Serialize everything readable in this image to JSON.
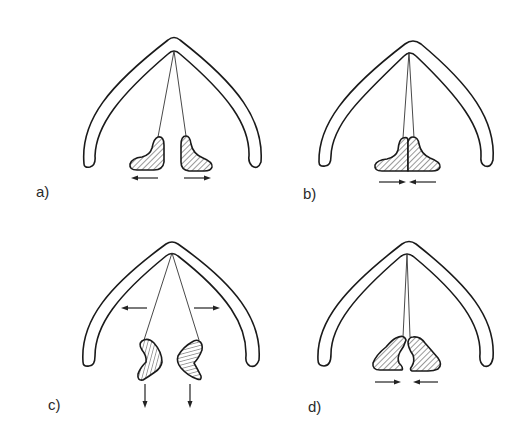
{
  "figure": {
    "panels": [
      {
        "id": "a",
        "label": "a)",
        "description": "Blocks pulled apart horizontally",
        "motion": [
          "left-block-left",
          "right-block-right"
        ]
      },
      {
        "id": "b",
        "label": "b)",
        "description": "Blocks pushed together horizontally",
        "motion": [
          "left-block-right",
          "right-block-left"
        ]
      },
      {
        "id": "c",
        "label": "c)",
        "description": "Arch pulled outward, blocks pulled downward",
        "motion": [
          "arch-left",
          "arch-right",
          "left-block-down",
          "right-block-down"
        ]
      },
      {
        "id": "d",
        "label": "d)",
        "description": "Concave blocks pushed together",
        "motion": [
          "left-block-right",
          "right-block-left"
        ]
      }
    ],
    "colors": {
      "line": "#1a1a1a",
      "background": "#ffffff"
    }
  }
}
